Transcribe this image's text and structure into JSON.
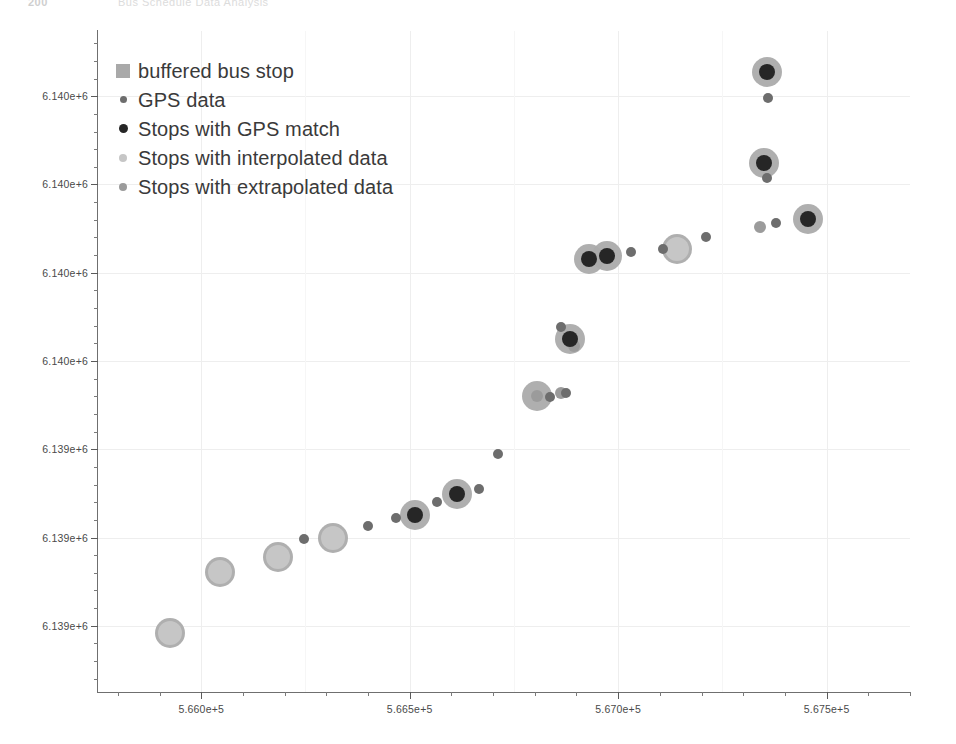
{
  "page": {
    "header_page_number": "200",
    "header_title": "Bus Schedule Data Analysis"
  },
  "legend": {
    "position": "upper-left",
    "items": [
      {
        "label": "buffered bus stop",
        "marker": "square-swatch",
        "color": "#a9a9a9",
        "size": 14
      },
      {
        "label": "GPS data",
        "marker": "small-dot",
        "color": "#6d6d6d",
        "size": 7
      },
      {
        "label": "Stops with GPS match",
        "marker": "small-dot",
        "color": "#262626",
        "size": 9
      },
      {
        "label": "Stops with interpolated data",
        "marker": "small-dot",
        "color": "#c6c6c6",
        "size": 8
      },
      {
        "label": "Stops with extrapolated data",
        "marker": "small-dot",
        "color": "#9b9b9b",
        "size": 8
      }
    ]
  },
  "axes": {
    "x_tick_labels": [
      "5.660e+5",
      "5.665e+5",
      "5.670e+5",
      "5.675e+5"
    ],
    "x_tick_values": [
      566000,
      566500,
      567000,
      567500
    ],
    "y_tick_labels": [
      "6.140e+6",
      "6.140e+6",
      "6.140e+6",
      "6.140e+6",
      "6.139e+6",
      "6.139e+6",
      "6.139e+6"
    ],
    "y_tick_values": [
      6140300,
      6140100,
      6139900,
      6139700,
      6139500,
      6139300,
      6139100
    ],
    "xlim": [
      565750,
      567700
    ],
    "ylim": [
      6138950,
      6140450
    ],
    "xlabel": "",
    "ylabel": "",
    "grid": true
  },
  "chart_data": {
    "type": "scatter",
    "title": "",
    "xlabel": "",
    "ylabel": "",
    "xlim": [
      565750,
      567700
    ],
    "ylim": [
      6138950,
      6140450
    ],
    "grid": true,
    "legend_position": "upper-left",
    "series": [
      {
        "name": "buffered bus stop",
        "marker": "circle",
        "color": "#ababab",
        "radius_px": 15,
        "points": [
          {
            "x": 565925,
            "y": 6139083
          },
          {
            "x": 566046,
            "y": 6139222
          },
          {
            "x": 566185,
            "y": 6139255
          },
          {
            "x": 566317,
            "y": 6139300
          },
          {
            "x": 566512,
            "y": 6139352
          },
          {
            "x": 566613,
            "y": 6139399
          },
          {
            "x": 566805,
            "y": 6139620
          },
          {
            "x": 566884,
            "y": 6139749
          },
          {
            "x": 566929,
            "y": 6139930
          },
          {
            "x": 566973,
            "y": 6139937
          },
          {
            "x": 567142,
            "y": 6139954
          },
          {
            "x": 567350,
            "y": 6140148
          },
          {
            "x": 567358,
            "y": 6140355
          },
          {
            "x": 567456,
            "y": 6140022
          }
        ]
      },
      {
        "name": "GPS data",
        "marker": "dot",
        "color": "#6d6d6d",
        "radius_px": 5,
        "points": [
          {
            "x": 566246,
            "y": 6139296
          },
          {
            "x": 566401,
            "y": 6139327
          },
          {
            "x": 566466,
            "y": 6139344
          },
          {
            "x": 566566,
            "y": 6139380
          },
          {
            "x": 566666,
            "y": 6139409
          },
          {
            "x": 566713,
            "y": 6139490
          },
          {
            "x": 566836,
            "y": 6139618
          },
          {
            "x": 566874,
            "y": 6139627
          },
          {
            "x": 566862,
            "y": 6139778
          },
          {
            "x": 567031,
            "y": 6139946
          },
          {
            "x": 567107,
            "y": 6139953
          },
          {
            "x": 567210,
            "y": 6139980
          },
          {
            "x": 567379,
            "y": 6140012
          },
          {
            "x": 567360,
            "y": 6140297
          },
          {
            "x": 567358,
            "y": 6140114
          }
        ]
      },
      {
        "name": "Stops with GPS match",
        "marker": "dot",
        "color": "#262626",
        "radius_px": 8,
        "points": [
          {
            "x": 566512,
            "y": 6139352
          },
          {
            "x": 566613,
            "y": 6139399
          },
          {
            "x": 566884,
            "y": 6139749
          },
          {
            "x": 566929,
            "y": 6139930
          },
          {
            "x": 566973,
            "y": 6139937
          },
          {
            "x": 567350,
            "y": 6140148
          },
          {
            "x": 567358,
            "y": 6140355
          },
          {
            "x": 567456,
            "y": 6140022
          }
        ]
      },
      {
        "name": "Stops with interpolated data",
        "marker": "dot",
        "color": "#c6c6c6",
        "radius_px": 12,
        "points": [
          {
            "x": 565925,
            "y": 6139083
          },
          {
            "x": 566046,
            "y": 6139222
          },
          {
            "x": 566185,
            "y": 6139255
          },
          {
            "x": 566317,
            "y": 6139300
          },
          {
            "x": 567142,
            "y": 6139954
          }
        ]
      },
      {
        "name": "Stops with extrapolated data",
        "marker": "dot",
        "color": "#9b9b9b",
        "radius_px": 6,
        "points": [
          {
            "x": 566805,
            "y": 6139620
          },
          {
            "x": 566862,
            "y": 6139627
          },
          {
            "x": 566893,
            "y": 6139733
          },
          {
            "x": 567341,
            "y": 6140003
          }
        ]
      }
    ]
  }
}
